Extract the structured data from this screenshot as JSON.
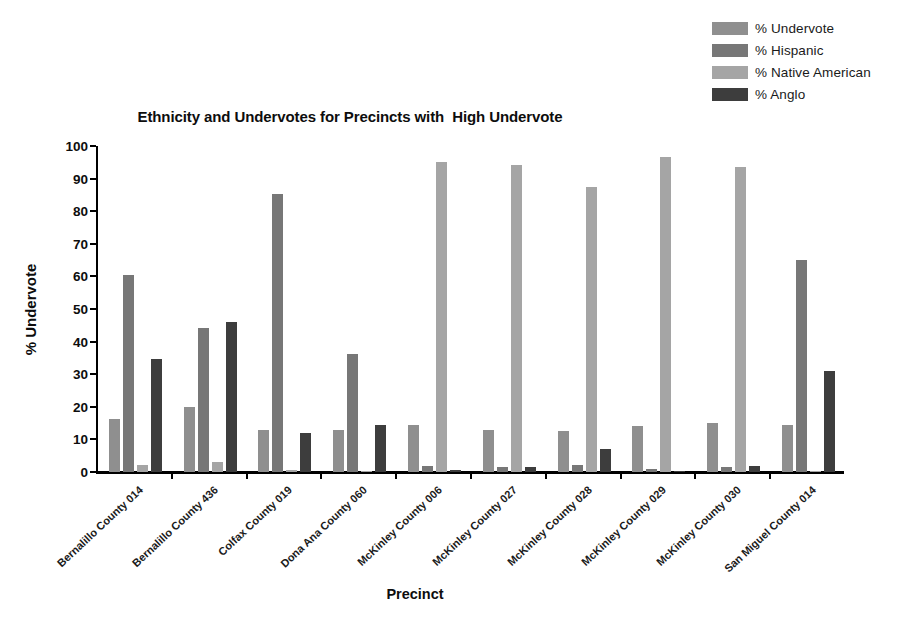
{
  "chart_data": {
    "type": "bar",
    "title": "Ethnicity and Undervotes for Precincts with  High Undervote",
    "xlabel": "Precinct",
    "ylabel": "% Undervote",
    "ylim": [
      0,
      100
    ],
    "yticks": [
      0,
      10,
      20,
      30,
      40,
      50,
      60,
      70,
      80,
      90,
      100
    ],
    "grid": false,
    "legend_position": "top-right",
    "categories": [
      "Bernalillo County 014",
      "Bernalillo County 436",
      "Colfax County 019",
      "Dona Ana County 060",
      "McKinley County 006",
      "McKinley County 027",
      "McKinley County 028",
      "McKinley County 029",
      "McKinley County 030",
      "San Miguel County 014"
    ],
    "series": [
      {
        "name": "% Undervote",
        "color": "#8f8f8f",
        "values": [
          16.2,
          19.8,
          13.0,
          13.0,
          14.3,
          13.0,
          12.5,
          14.2,
          15.1,
          14.3
        ]
      },
      {
        "name": "% Hispanic",
        "color": "#777777",
        "values": [
          60.5,
          44.2,
          85.3,
          36.2,
          1.7,
          1.4,
          2.3,
          0.8,
          1.5,
          65.0
        ]
      },
      {
        "name": "% Native American",
        "color": "#a5a5a5",
        "values": [
          2.1,
          3.0,
          0.6,
          0.3,
          95.0,
          94.2,
          87.3,
          96.5,
          93.5,
          0.4
        ]
      },
      {
        "name": "% Anglo",
        "color": "#3d3d3d",
        "values": [
          34.6,
          46.0,
          12.0,
          14.3,
          0.5,
          1.5,
          7.0,
          0.3,
          1.8,
          31.0
        ]
      }
    ]
  },
  "legend": {
    "items": [
      {
        "label": "% Undervote",
        "color": "#8f8f8f"
      },
      {
        "label": "% Hispanic",
        "color": "#777777"
      },
      {
        "label": "% Native American",
        "color": "#a5a5a5"
      },
      {
        "label": "% Anglo",
        "color": "#3d3d3d"
      }
    ]
  }
}
